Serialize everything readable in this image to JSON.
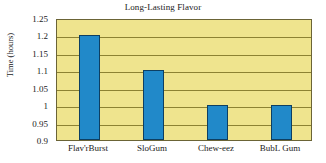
{
  "chart_data": {
    "type": "bar",
    "title": "Long-Lasting Flavor",
    "xlabel": "",
    "ylabel": "Time (hours)",
    "categories": [
      "Flav'rBurst",
      "SloGum",
      "Chew-eez",
      "BubL Gum"
    ],
    "values": [
      1.2,
      1.1,
      1.0,
      1.0
    ],
    "ylim": [
      0.9,
      1.25
    ],
    "yticks": [
      0.9,
      0.95,
      1.0,
      1.05,
      1.1,
      1.15,
      1.2,
      1.25
    ],
    "ytick_labels": [
      "0.9",
      "0.95",
      "1",
      "1.05",
      "1.1",
      "1.15",
      "1.2",
      "1.25"
    ],
    "grid": true,
    "legend": null,
    "colors": {
      "bar_fill": "#2189c9",
      "bar_edge": "#0d3f63",
      "plot_background": "#efe48e",
      "gridline": "#8d8233",
      "plot_border": "#6b6436",
      "text": "#1a1a1a",
      "figure_background": "#ffffff"
    }
  }
}
